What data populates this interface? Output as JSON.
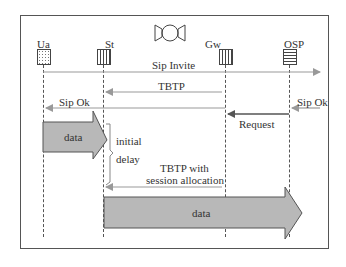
{
  "diagram": {
    "type": "sequence-diagram",
    "colors": {
      "frame": "#555555",
      "arrow_line": "#999999",
      "arrow_dark": "#555555",
      "data_fill": "#b8b8b8",
      "data_stroke": "#555555"
    },
    "entities": [
      {
        "id": "ua",
        "label": "Ua",
        "icon": "dotted-box-icon"
      },
      {
        "id": "st",
        "label": "St",
        "icon": "vertical-striped-box-icon"
      },
      {
        "id": "sat",
        "label": "",
        "icon": "satellite-icon"
      },
      {
        "id": "gw",
        "label": "Gw",
        "icon": "vertical-striped-box-icon"
      },
      {
        "id": "osp",
        "label": "OSP",
        "icon": "horizontal-striped-box-icon"
      }
    ],
    "messages": [
      {
        "label": "Sip Invite",
        "from": "Ua",
        "to": "beyond OSP"
      },
      {
        "label": "TBTP",
        "from": "Gw",
        "to": "St"
      },
      {
        "label": "Sip Ok",
        "from": "St",
        "to": "Ua"
      },
      {
        "label": "Sip Ok",
        "from": "beyond OSP",
        "to": "OSP"
      },
      {
        "label": "Request",
        "from": "OSP",
        "to": "Gw"
      },
      {
        "label": "TBTP with",
        "label2": "session allocation",
        "from": "Gw",
        "to": "St"
      }
    ],
    "data_flows": [
      {
        "label": "data",
        "from": "Ua",
        "to": "St"
      },
      {
        "label": "data",
        "from": "St",
        "to": "OSP"
      }
    ],
    "annotation": {
      "line1": "initial",
      "line2": "delay"
    }
  }
}
